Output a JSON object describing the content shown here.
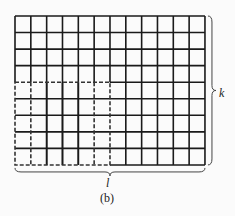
{
  "figure": {
    "caption": "(b)",
    "grid": {
      "columns": 12,
      "rows": 9,
      "x0": 15,
      "y0": 16,
      "cell_w": 15.83,
      "cell_h": 16.55,
      "line_color": "#1a1a1a"
    },
    "dashed_region": {
      "col_start": 0,
      "col_end": 6,
      "row_start": 4,
      "row_end": 9,
      "inner_dashed_cols": [
        1,
        5
      ],
      "color": "#333333"
    },
    "right_brace_label": "k",
    "bottom_brace_label": "l"
  }
}
